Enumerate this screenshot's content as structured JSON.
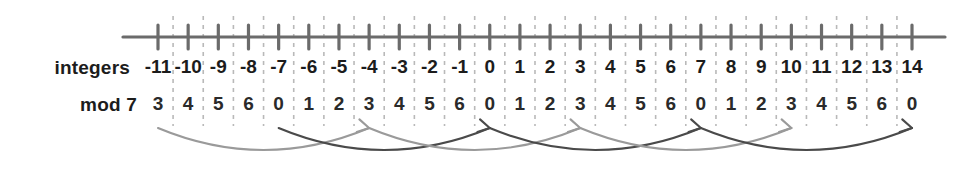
{
  "figure": {
    "rows": {
      "integers_label": "integers",
      "mod_label": "mod 7"
    }
  },
  "chart_data": {
    "type": "line",
    "xlabel": "integers",
    "ylabel": "mod 7",
    "grid": true,
    "legend": "none",
    "xlim": [
      -11,
      14
    ],
    "categories": [
      -11,
      -10,
      -9,
      -8,
      -7,
      -6,
      -5,
      -4,
      -3,
      -2,
      -1,
      0,
      1,
      2,
      3,
      4,
      5,
      6,
      7,
      8,
      9,
      10,
      11,
      12,
      13,
      14
    ],
    "series": [
      {
        "name": "integers",
        "values": [
          "-11",
          "-10",
          "-9",
          "-8",
          "-7",
          "-6",
          "-5",
          "-4",
          "-3",
          "-2",
          "-1",
          "0",
          "1",
          "2",
          "3",
          "4",
          "5",
          "6",
          "7",
          "8",
          "9",
          "10",
          "11",
          "12",
          "13",
          "14"
        ]
      },
      {
        "name": "mod 7",
        "values": [
          "3",
          "4",
          "5",
          "6",
          "0",
          "1",
          "2",
          "3",
          "4",
          "5",
          "6",
          "0",
          "1",
          "2",
          "3",
          "4",
          "5",
          "6",
          "0",
          "1",
          "2",
          "3",
          "4",
          "5",
          "6",
          "0"
        ]
      }
    ],
    "arcs": [
      {
        "from": -11,
        "to": -4,
        "color": "#9a9a9a"
      },
      {
        "from": -7,
        "to": 0,
        "color": "#4a4a4a"
      },
      {
        "from": -4,
        "to": 3,
        "color": "#9a9a9a"
      },
      {
        "from": 0,
        "to": 7,
        "color": "#4a4a4a"
      },
      {
        "from": 3,
        "to": 10,
        "color": "#9a9a9a"
      },
      {
        "from": 7,
        "to": 14,
        "color": "#4a4a4a"
      }
    ],
    "colors": {
      "axis": "#6b6b6b",
      "tick": "#6b6b6b",
      "dashed_grid": "#b9b9b9",
      "text": "#1c1c1c",
      "arc_light": "#9a9a9a",
      "arc_dark": "#4a4a4a"
    }
  }
}
